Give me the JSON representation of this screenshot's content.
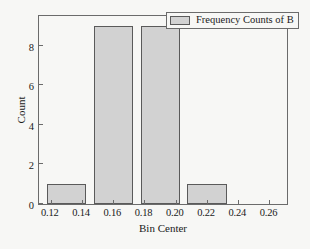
{
  "chart_data": {
    "type": "bar",
    "title": "",
    "subtitle": "",
    "xlabel": "Bin Center",
    "ylabel": "Count",
    "xlim": [
      0.1125,
      0.2725
    ],
    "ylim": [
      0,
      9.6
    ],
    "grid": false,
    "legend_position": "top-right",
    "legend": [
      "Frequency Counts of B"
    ],
    "xticks": [
      "0.12",
      "0.14",
      "0.16",
      "0.18",
      "0.20",
      "0.22",
      "0.24",
      "0.26"
    ],
    "xtick_values": [
      0.12,
      0.14,
      0.16,
      0.18,
      0.2,
      0.22,
      0.24,
      0.26
    ],
    "yticks": [
      "0",
      "2",
      "4",
      "6",
      "8"
    ],
    "ytick_values": [
      0,
      2,
      4,
      6,
      8
    ],
    "bin_edges": [
      0.1175,
      0.1425,
      0.1475,
      0.1725,
      0.1775,
      0.2025,
      0.2075,
      0.2325
    ],
    "categories": [
      "0.130",
      "0.160",
      "0.190",
      "0.220"
    ],
    "values": [
      1,
      9,
      9,
      1
    ],
    "bars": [
      {
        "label": "0.130",
        "value": 1,
        "x_start": 0.1175,
        "x_end": 0.1425
      },
      {
        "label": "0.160",
        "value": 9,
        "x_start": 0.1475,
        "x_end": 0.1725
      },
      {
        "label": "0.190",
        "value": 9,
        "x_start": 0.1775,
        "x_end": 0.2025
      },
      {
        "label": "0.220",
        "value": 1,
        "x_start": 0.2075,
        "x_end": 0.2325
      }
    ],
    "series": [
      {
        "name": "Frequency Counts of B",
        "values": [
          1,
          9,
          9,
          1
        ]
      }
    ],
    "colors": {
      "bar_fill": "#d2d2d2",
      "bar_edge": "#5a5a5a",
      "axis": "#6b6b6b",
      "text": "#1a1a1a",
      "background": "#f7f7f5"
    }
  }
}
